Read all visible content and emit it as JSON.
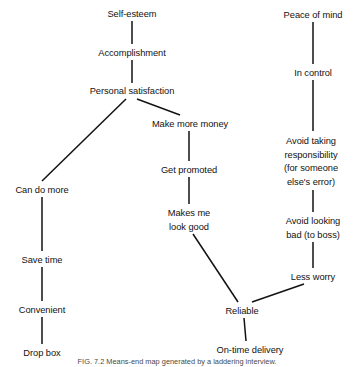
{
  "figure": {
    "type": "means-end-chain-ladder-diagram",
    "caption": "FIG. 7.2 Means-end map generated by a laddering interview.",
    "stroke_color": "#121212",
    "background_color": "#ffffff",
    "width": 355,
    "height": 367
  },
  "nodes": [
    {
      "id": "self-esteem",
      "lines": [
        "Self-esteem"
      ],
      "x": 132,
      "y": 8
    },
    {
      "id": "accomplishment",
      "lines": [
        "Accomplishment"
      ],
      "x": 132,
      "y": 47
    },
    {
      "id": "personal-satisfaction",
      "lines": [
        "Personal satisfaction"
      ],
      "x": 132,
      "y": 85
    },
    {
      "id": "make-more-money",
      "lines": [
        "Make more money"
      ],
      "x": 190,
      "y": 118
    },
    {
      "id": "get-promoted",
      "lines": [
        "Get promoted"
      ],
      "x": 189,
      "y": 164
    },
    {
      "id": "makes-me-look-good",
      "lines": [
        "Makes me",
        "look good"
      ],
      "x": 189,
      "y": 207
    },
    {
      "id": "can-do-more",
      "lines": [
        "Can do more"
      ],
      "x": 42,
      "y": 184
    },
    {
      "id": "save-time",
      "lines": [
        "Save time"
      ],
      "x": 42,
      "y": 254
    },
    {
      "id": "convenient",
      "lines": [
        "Convenient"
      ],
      "x": 42,
      "y": 304
    },
    {
      "id": "drop-box",
      "lines": [
        "Drop box"
      ],
      "x": 42,
      "y": 347
    },
    {
      "id": "reliable",
      "lines": [
        "Reliable"
      ],
      "x": 242,
      "y": 305
    },
    {
      "id": "on-time-delivery",
      "lines": [
        "On-time delivery"
      ],
      "x": 250,
      "y": 344
    },
    {
      "id": "peace-of-mind",
      "lines": [
        "Peace of mind"
      ],
      "x": 313,
      "y": 9
    },
    {
      "id": "in-control",
      "lines": [
        "In control"
      ],
      "x": 313,
      "y": 67
    },
    {
      "id": "avoid-taking-responsibility",
      "lines": [
        "Avoid taking",
        "responsibility",
        "(for someone",
        "else's error)"
      ],
      "x": 311,
      "y": 135
    },
    {
      "id": "avoid-looking-bad",
      "lines": [
        "Avoid looking",
        "bad (to boss)"
      ],
      "x": 313,
      "y": 215
    },
    {
      "id": "less-worry",
      "lines": [
        "Less worry"
      ],
      "x": 313,
      "y": 271
    }
  ],
  "edges": [
    {
      "from": "self-esteem",
      "to": "accomplishment",
      "x1": 132,
      "y1": 21,
      "x2": 132,
      "y2": 44
    },
    {
      "from": "accomplishment",
      "to": "personal-satisfaction",
      "x1": 132,
      "y1": 60,
      "x2": 132,
      "y2": 83
    },
    {
      "from": "personal-satisfaction",
      "to": "can-do-more",
      "x1": 126,
      "y1": 99,
      "x2": 42,
      "y2": 181
    },
    {
      "from": "personal-satisfaction",
      "to": "make-more-money",
      "x1": 137,
      "y1": 99,
      "x2": 180,
      "y2": 115
    },
    {
      "from": "make-more-money",
      "to": "get-promoted",
      "x1": 189,
      "y1": 131,
      "x2": 189,
      "y2": 161
    },
    {
      "from": "get-promoted",
      "to": "makes-me-look-good",
      "x1": 189,
      "y1": 177,
      "x2": 189,
      "y2": 204
    },
    {
      "from": "makes-me-look-good",
      "to": "reliable",
      "x1": 193,
      "y1": 234,
      "x2": 238,
      "y2": 302
    },
    {
      "from": "can-do-more",
      "to": "save-time",
      "x1": 42,
      "y1": 197,
      "x2": 42,
      "y2": 251
    },
    {
      "from": "save-time",
      "to": "convenient",
      "x1": 42,
      "y1": 267,
      "x2": 42,
      "y2": 301
    },
    {
      "from": "convenient",
      "to": "drop-box",
      "x1": 42,
      "y1": 317,
      "x2": 42,
      "y2": 344
    },
    {
      "from": "reliable",
      "to": "on-time-delivery",
      "x1": 244,
      "y1": 318,
      "x2": 246,
      "y2": 341
    },
    {
      "from": "peace-of-mind",
      "to": "in-control",
      "x1": 313,
      "y1": 22,
      "x2": 313,
      "y2": 64
    },
    {
      "from": "in-control",
      "to": "avoid-taking-responsibility",
      "x1": 313,
      "y1": 80,
      "x2": 313,
      "y2": 131
    },
    {
      "from": "avoid-taking-responsibility",
      "to": "avoid-looking-bad",
      "x1": 313,
      "y1": 190,
      "x2": 313,
      "y2": 212
    },
    {
      "from": "avoid-looking-bad",
      "to": "less-worry",
      "x1": 313,
      "y1": 242,
      "x2": 313,
      "y2": 268
    },
    {
      "from": "less-worry",
      "to": "reliable",
      "x1": 304,
      "y1": 284,
      "x2": 252,
      "y2": 302
    }
  ]
}
